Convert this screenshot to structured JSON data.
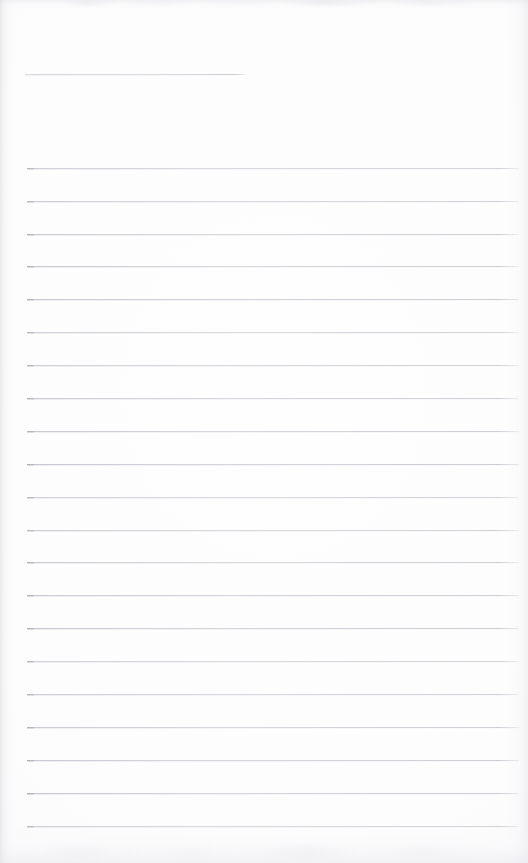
{
  "document": {
    "kind": "scanned-blank-lined-page",
    "title": "Blank Lined Notebook Page",
    "has_text_content": false,
    "visible_text": "",
    "page_width": 528,
    "page_height": 863
  },
  "colors": {
    "page_background": "#fdfdfd",
    "rule_line": "#c9c9cd",
    "rule_line_start_accent": "#a6a6ad",
    "edge_shadow": "#d8d8dd"
  },
  "header_rule": {
    "name": "short-header-rule",
    "x_start": 25,
    "x_end": 247,
    "y": 74,
    "length": 222,
    "thickness": 1
  },
  "ruled_lines": {
    "count": 21,
    "x_start": 27,
    "x_end": 519,
    "length": 492,
    "thickness": 1,
    "spacing": 32.9,
    "first_y": 168,
    "last_y": 827,
    "y_positions": [
      168,
      201,
      234,
      266,
      299,
      332,
      365,
      398,
      431,
      464,
      497,
      530,
      562,
      595,
      628,
      661,
      694,
      727,
      760,
      793,
      826
    ]
  },
  "margins": {
    "top_blank_height": 74,
    "left_margin": 27,
    "right_margin": 9,
    "bottom_blank_height": 36
  },
  "artifacts": {
    "top_smudge_band": "faint mottled scanner marks along the top edge",
    "bottom_smudge_band": "faint mottled scanner marks along the bottom edge",
    "left_edge_shading": "soft gray gradient down the left edge",
    "right_edge_shading": "soft gray gradient down the right edge"
  }
}
